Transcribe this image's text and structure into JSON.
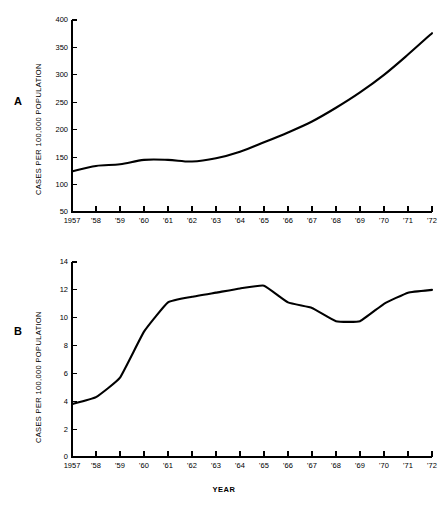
{
  "figure": {
    "background": "#ffffff",
    "line_color": "#000000"
  },
  "panels": [
    {
      "id": "A",
      "label": "A",
      "ylabel": "CASES PER 100,000 POPULATION",
      "xlabel": ""
    },
    {
      "id": "B",
      "label": "B",
      "ylabel": "CASES PER 100,000 POPULATION",
      "xlabel": "YEAR"
    }
  ],
  "chart_data": [
    {
      "type": "line",
      "panel": "A",
      "title": "",
      "xlabel": "",
      "ylabel": "CASES PER 100,000 POPULATION",
      "x": [
        1957,
        1958,
        1959,
        1960,
        1961,
        1962,
        1963,
        1964,
        1965,
        1966,
        1967,
        1968,
        1969,
        1970,
        1971,
        1972
      ],
      "categories": [
        "1957",
        "'58",
        "'59",
        "'60",
        "'61",
        "'62",
        "'63",
        "'64",
        "'65",
        "'66",
        "'67",
        "'68",
        "'69",
        "'70",
        "'71",
        "'72"
      ],
      "values": [
        124,
        134,
        137,
        145,
        145,
        142,
        148,
        160,
        177,
        195,
        215,
        240,
        268,
        300,
        337,
        376
      ],
      "ylim": [
        50,
        400
      ],
      "yticks": [
        50,
        100,
        150,
        200,
        250,
        300,
        350,
        400
      ],
      "ytick_labels": [
        "50",
        "100",
        "150",
        "200",
        "250",
        "300",
        "350",
        "400"
      ],
      "grid": false,
      "legend": "none"
    },
    {
      "type": "line",
      "panel": "B",
      "title": "",
      "xlabel": "YEAR",
      "ylabel": "CASES PER 100,000 POPULATION",
      "x": [
        1957,
        1958,
        1959,
        1960,
        1961,
        1962,
        1963,
        1964,
        1965,
        1966,
        1967,
        1968,
        1969,
        1970,
        1971,
        1972
      ],
      "categories": [
        "1957",
        "'58",
        "'59",
        "'60",
        "'61",
        "'62",
        "'63",
        "'64",
        "'65",
        "'66",
        "'67",
        "'68",
        "'69",
        "'70",
        "'71",
        "'72"
      ],
      "values": [
        3.8,
        4.3,
        5.7,
        9.0,
        11.1,
        11.5,
        11.8,
        12.1,
        12.3,
        11.1,
        10.7,
        9.75,
        9.75,
        11.0,
        11.8,
        12.0
      ],
      "ylim": [
        0,
        14
      ],
      "yticks": [
        0,
        2,
        4,
        6,
        8,
        10,
        12,
        14
      ],
      "ytick_labels": [
        "0",
        "2",
        "4",
        "6",
        "8",
        "10",
        "12",
        "14"
      ],
      "grid": false,
      "legend": "none"
    }
  ]
}
